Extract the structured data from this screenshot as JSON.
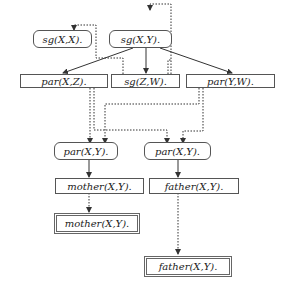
{
  "diagram": {
    "type": "proof-tree / SLD derivation graph",
    "nodes": {
      "sg_xx": {
        "label": "sg(X,X).",
        "shape": "rounded"
      },
      "sg_xy": {
        "label": "sg(X,Y).",
        "shape": "rounded"
      },
      "par_xz": {
        "label": "par(X,Z).",
        "shape": "rect"
      },
      "sg_zw": {
        "label": "sg(Z,W).",
        "shape": "rect"
      },
      "par_yw": {
        "label": "par(Y,W).",
        "shape": "rect"
      },
      "par_xy_l": {
        "label": "par(X,Y).",
        "shape": "rounded"
      },
      "par_xy_r": {
        "label": "par(X,Y).",
        "shape": "rounded"
      },
      "mother_xy": {
        "label": "mother(X,Y).",
        "shape": "rect"
      },
      "father_xy": {
        "label": "father(X,Y).",
        "shape": "rect"
      },
      "mother_fact": {
        "label": "mother(X,Y).",
        "shape": "double-rect"
      },
      "father_fact": {
        "label": "father(X,Y).",
        "shape": "double-rect"
      }
    },
    "edges": [
      {
        "from": "sg_xy",
        "to": "par_xz",
        "style": "solid"
      },
      {
        "from": "sg_xy",
        "to": "sg_zw",
        "style": "solid"
      },
      {
        "from": "sg_xy",
        "to": "par_yw",
        "style": "solid"
      },
      {
        "from": "sg_zw",
        "to": "sg_xx",
        "style": "dotted"
      },
      {
        "from": "sg_zw",
        "to": "sg_xy",
        "style": "dotted"
      },
      {
        "from": "par_xz",
        "to": "par_xy_l",
        "style": "dotted"
      },
      {
        "from": "par_xz",
        "to": "par_xy_r",
        "style": "dotted"
      },
      {
        "from": "par_yw",
        "to": "par_xy_l",
        "style": "dotted"
      },
      {
        "from": "par_yw",
        "to": "par_xy_r",
        "style": "dotted"
      },
      {
        "from": "par_xy_l",
        "to": "mother_xy",
        "style": "solid"
      },
      {
        "from": "par_xy_r",
        "to": "father_xy",
        "style": "solid"
      },
      {
        "from": "mother_xy",
        "to": "mother_fact",
        "style": "dotted"
      },
      {
        "from": "father_xy",
        "to": "father_fact",
        "style": "dotted"
      }
    ]
  }
}
